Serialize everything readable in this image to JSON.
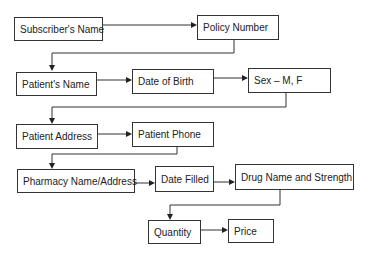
{
  "diagram": {
    "type": "flowchart",
    "nodes": {
      "subscriber_name": "Subscriber's Name",
      "policy_number": "Policy Number",
      "patient_name": "Patient's Name",
      "date_of_birth": "Date of Birth",
      "sex": "Sex – M, F",
      "patient_address": "Patient Address",
      "patient_phone": "Patient Phone",
      "pharmacy": "Pharmacy Name/Address",
      "date_filled": "Date Filled",
      "drug": "Drug Name and Strength",
      "quantity": "Quantity",
      "price": "Price"
    },
    "edges": [
      [
        "Subscriber's Name",
        "Policy Number"
      ],
      [
        "Policy Number",
        "Patient's Name"
      ],
      [
        "Patient's Name",
        "Date of Birth"
      ],
      [
        "Date of Birth",
        "Sex – M, F"
      ],
      [
        "Sex – M, F",
        "Patient Address"
      ],
      [
        "Patient Address",
        "Patient Phone"
      ],
      [
        "Patient Phone",
        "Pharmacy Name/Address"
      ],
      [
        "Pharmacy Name/Address",
        "Date Filled"
      ],
      [
        "Date Filled",
        "Drug Name and Strength"
      ],
      [
        "Drug Name and Strength",
        "Quantity"
      ],
      [
        "Quantity",
        "Price"
      ]
    ],
    "colors": {
      "stroke": "#333333",
      "background": "#ffffff",
      "text": "#222222"
    }
  }
}
